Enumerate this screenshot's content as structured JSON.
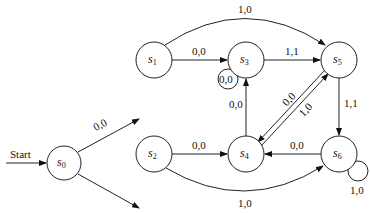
{
  "diagram": {
    "type": "finite-state-machine",
    "start_label": "Start",
    "states": [
      {
        "id": "s0",
        "name": "s",
        "sub": "0",
        "x": 64,
        "y": 112
      },
      {
        "id": "s1",
        "name": "s",
        "sub": "1",
        "x": 154,
        "y": 60
      },
      {
        "id": "s3",
        "name": "s",
        "sub": "3",
        "x": 246,
        "y": 60
      },
      {
        "id": "s5",
        "name": "s",
        "sub": "5",
        "x": 339,
        "y": 60
      },
      {
        "id": "s2",
        "name": "s",
        "sub": "2",
        "x": 154,
        "y": 154
      },
      {
        "id": "s4",
        "name": "s",
        "sub": "4",
        "x": 246,
        "y": 154
      },
      {
        "id": "s6",
        "name": "s",
        "sub": "6",
        "x": 339,
        "y": 154
      }
    ],
    "edges": [
      {
        "from": "start",
        "to": "s0",
        "label": "Start"
      },
      {
        "from": "s0",
        "to": "s1",
        "label": "0,0"
      },
      {
        "from": "s0",
        "to": "s2",
        "label": "1,0"
      },
      {
        "from": "s1",
        "to": "s3",
        "label": "0,0"
      },
      {
        "from": "s1",
        "to": "s5",
        "label": "1,0"
      },
      {
        "from": "s3",
        "to": "s3",
        "label": "0,0"
      },
      {
        "from": "s3",
        "to": "s5",
        "label": "1,1"
      },
      {
        "from": "s2",
        "to": "s4",
        "label": "0,0"
      },
      {
        "from": "s2",
        "to": "s6",
        "label": "1,0"
      },
      {
        "from": "s4",
        "to": "s3",
        "label": "0,0"
      },
      {
        "from": "s4",
        "to": "s5",
        "label": "1,0"
      },
      {
        "from": "s5",
        "to": "s4",
        "label": "0,0"
      },
      {
        "from": "s5",
        "to": "s6",
        "label": "1,1"
      },
      {
        "from": "s6",
        "to": "s4",
        "label": "0,0"
      },
      {
        "from": "s6",
        "to": "s6",
        "label": "1,0"
      }
    ]
  },
  "labels": {
    "start": "Start",
    "s0_s1": "0,0",
    "s0_s2": "1,0",
    "s1_s3": "0,0",
    "s1_s5": "1,0",
    "s3_loop": "0,0",
    "s3_s5": "1,1",
    "s2_s4": "0,0",
    "s2_s6": "1,0",
    "s4_s3": "0,0",
    "s4_s5": "1,0",
    "s5_s4": "0,0",
    "s5_s6": "1,1",
    "s6_s4": "0,0",
    "s6_loop": "1,0"
  },
  "nodes": {
    "s0": {
      "name": "s",
      "sub": "0"
    },
    "s1": {
      "name": "s",
      "sub": "1"
    },
    "s2": {
      "name": "s",
      "sub": "2"
    },
    "s3": {
      "name": "s",
      "sub": "3"
    },
    "s4": {
      "name": "s",
      "sub": "4"
    },
    "s5": {
      "name": "s",
      "sub": "5"
    },
    "s6": {
      "name": "s",
      "sub": "6"
    }
  }
}
